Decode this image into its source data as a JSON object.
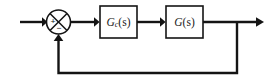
{
  "diagram": {
    "type": "control-block-diagram",
    "background_color": "#ffffff",
    "line_color": "#141414",
    "blocks": [
      {
        "id": "controller",
        "name": "controller-block",
        "label": "Gc(s)",
        "label_main": "G",
        "label_subscript": "c",
        "label_argument": "(s)",
        "x": 100,
        "y": 6,
        "width": 37,
        "height": 32
      },
      {
        "id": "plant",
        "name": "plant-block",
        "label": "G(s)",
        "label_main": "G",
        "label_subscript": "",
        "label_argument": "(s)",
        "x": 166,
        "y": 6,
        "width": 37,
        "height": 32
      }
    ],
    "summing_junction": {
      "name": "summing-junction",
      "center_x": 58.5,
      "center_y": 22,
      "radius": 12,
      "positive_sign": "+",
      "negative_sign": "−",
      "positive_position": "left",
      "negative_position": "bottom"
    },
    "signals": {
      "input_label": "",
      "output_label": "",
      "feedback_label": ""
    },
    "connections": [
      {
        "name": "input-wire",
        "from": "input",
        "to": "summing-junction",
        "arrow": true
      },
      {
        "name": "error-wire",
        "from": "summing-junction",
        "to": "controller-block",
        "arrow": true
      },
      {
        "name": "controller-to-plant-wire",
        "from": "controller-block",
        "to": "plant-block",
        "arrow": true
      },
      {
        "name": "output-wire",
        "from": "plant-block",
        "to": "output",
        "arrow": true
      },
      {
        "name": "feedback-wire",
        "from": "output-tap",
        "to": "summing-junction",
        "arrow": true
      }
    ]
  }
}
